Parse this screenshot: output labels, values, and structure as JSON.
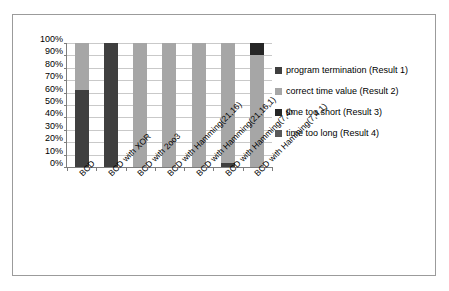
{
  "chart_data": {
    "type": "bar",
    "stacked": true,
    "normalized": true,
    "title": "",
    "xlabel": "",
    "ylabel": "",
    "ylim": [
      0,
      100
    ],
    "grid": true,
    "legend_position": "right",
    "categories": [
      "BCD",
      "BCD with XOR",
      "BCD with 2oo3",
      "BCD with Hamming(21,16)",
      "BCD with Hamming(21,16,1)",
      "BCD with Hamming(7,4)",
      "BCD with Hamming(7,4,1)"
    ],
    "y_ticks": [
      "0%",
      "10%",
      "20%",
      "30%",
      "40%",
      "50%",
      "60%",
      "70%",
      "80%",
      "90%",
      "100%"
    ],
    "y_tick_values": [
      0,
      10,
      20,
      30,
      40,
      50,
      60,
      70,
      80,
      90,
      100
    ],
    "series": [
      {
        "name": "program termination (Result 1)",
        "color": "#3f3f3f",
        "values": [
          62,
          100,
          0,
          0,
          0,
          3,
          0
        ]
      },
      {
        "name": "correct time value (Result 2)",
        "color": "#a6a6a6",
        "values": [
          38,
          0,
          100,
          100,
          100,
          97,
          90
        ]
      },
      {
        "name": "time too short (Result 3)",
        "color": "#262626",
        "values": [
          0,
          0,
          0,
          0,
          0,
          0,
          10
        ]
      },
      {
        "name": "time too long (Result 4)",
        "color": "#808080",
        "values": [
          0,
          0,
          0,
          0,
          0,
          0,
          0
        ]
      }
    ],
    "legend": [
      {
        "label": "program termination (Result 1)",
        "color": "#3f3f3f"
      },
      {
        "label": "correct time value (Result 2)",
        "color": "#a6a6a6"
      },
      {
        "label": "time too short (Result 3)",
        "color": "#262626"
      },
      {
        "label": "time too long (Result 4)",
        "color": "#595959"
      }
    ]
  }
}
